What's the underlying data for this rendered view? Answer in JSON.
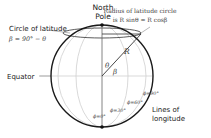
{
  "diagram": {
    "labels": {
      "north_pole_line1": "North",
      "north_pole_line2": "Pole",
      "circle_of_latitude": "Circle of latitude",
      "beta_formula": "β = 90° − θ",
      "radius_line1": "Radius of latitude circle",
      "radius_line2": "is R sinθ = R cosβ",
      "equator": "Equator",
      "lines_of_longitude_line1": "Lines of",
      "lines_of_longitude_line2": "longitude",
      "R": "R",
      "theta": "θ",
      "beta": "β",
      "phi_0": "ϕ=0°",
      "phi_30": "ϕ=30°",
      "phi_60": "ϕ=60°",
      "phi_90": "ϕ=90°"
    },
    "colors": {
      "sphere_outline": "#1a1a1a",
      "meridians": "#c8c8c8",
      "text": "#222222",
      "math_text": "#555555"
    }
  }
}
